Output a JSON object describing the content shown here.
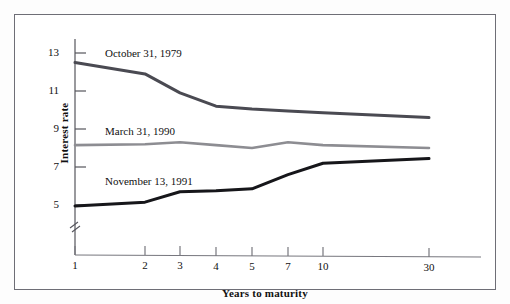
{
  "figure": {
    "background": "#ffffff",
    "frame_color": "#6e6e76"
  },
  "chart_data": {
    "type": "line",
    "title": "",
    "xlabel": "Years to maturity",
    "ylabel": "Interest rate",
    "x": [
      1,
      2,
      3,
      4,
      5,
      7,
      10,
      30
    ],
    "categories": [
      "1",
      "2",
      "3",
      "4",
      "5",
      "7",
      "10",
      "30"
    ],
    "xtick_labels": [
      "1",
      "2",
      "3",
      "4",
      "5",
      "7",
      "10",
      "30"
    ],
    "ytick_labels": [
      "5",
      "7",
      "9",
      "11",
      "13"
    ],
    "yticks": [
      5,
      7,
      9,
      11,
      13
    ],
    "ylim": [
      4.2,
      13.6
    ],
    "y_axis_break": true,
    "grid": false,
    "legend_position": "inline-annotations",
    "series": [
      {
        "name": "October 31, 1979",
        "color": "#4a4a52",
        "width": 3.0,
        "values": [
          12.5,
          11.9,
          10.9,
          10.2,
          10.05,
          9.95,
          9.85,
          9.6
        ]
      },
      {
        "name": "March 31, 1990",
        "color": "#8d8d92",
        "width": 2.6,
        "values": [
          8.15,
          8.2,
          8.3,
          8.15,
          8.0,
          8.3,
          8.15,
          8.0
        ]
      },
      {
        "name": "November 13, 1991",
        "color": "#16161a",
        "width": 3.0,
        "values": [
          4.95,
          5.15,
          5.7,
          5.75,
          5.85,
          6.6,
          7.2,
          7.45
        ]
      }
    ],
    "annotations": [
      {
        "text": "October 31, 1979",
        "x_px": 90,
        "y_px": 38
      },
      {
        "text": "March 31, 1990",
        "x_px": 90,
        "y_px": 116
      },
      {
        "text": "November 13, 1991",
        "x_px": 90,
        "y_px": 166
      }
    ]
  }
}
